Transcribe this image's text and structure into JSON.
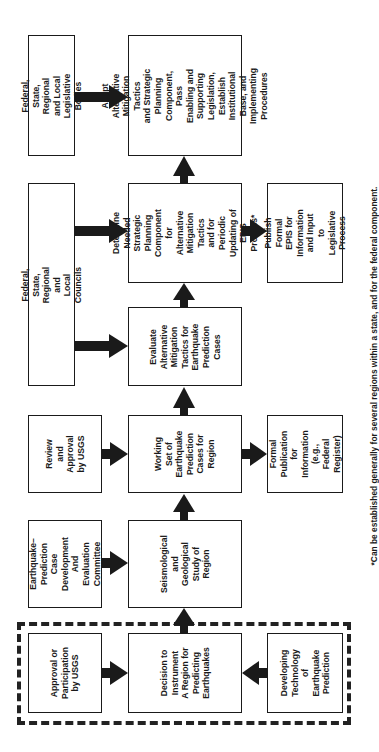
{
  "diagram": {
    "orientation": "rotated-90-ccw",
    "colors": {
      "ink": "#1a1a1a",
      "background": "#ffffff"
    },
    "boxes": {
      "legislative_bodies": "Federal, State,\nRegional and Local\nLegislative Bodies",
      "adopt": "Adopt Alternative\nMitigation Tactics\nand Strategic\nPlanning Component,\nPass Enabling and\nSupporting Legislation,\nEstablish Institutional\nBase, and Implementing\nProcedures",
      "councils": "Federal, State, Regional\nand Local Councils",
      "determine": "Determine Needed\nStrategic Planning\nComponent for\nAlternative\nMitigation Tactics\nand for Periodic\nUpdating of\nEPIS Process*",
      "publish_epis": "Publish Formal\nEPIS for\nInformation\nand Input to\nLegislative\nProcess",
      "evaluate": "Evaluate\nAlternative\nMitigation\nTactics for\nEarthquake\nPrediction\nCases",
      "review_usgs": "Review and\nApproval\nby USGS",
      "working_set": "Working\nSet of\nEarthquake\nPrediction\nCases for\nRegion",
      "formal_publication": "Formal\nPublication\nfor\nInformation\n(e.g., Federal\nRegister)",
      "committee": "Earthquake–\nPrediction Case\nDevelopment\nAnd Evaluation\nCommittee",
      "seismological": "Seismological\nand\nGeological\nStudy of\nRegion",
      "approval_usgs": "Approval or\nParticipation\nby USGS",
      "decision": "Decision to\nInstrument\nA Region for\nPredicting\nEarthquakes",
      "developing_tech": "Developing\nTechnology of\nEarthquake\nPrediction"
    },
    "flows": [
      [
        "legislative_bodies",
        "adopt"
      ],
      [
        "councils",
        "determine"
      ],
      [
        "councils",
        "evaluate"
      ],
      [
        "determine",
        "adopt"
      ],
      [
        "determine",
        "publish_epis"
      ],
      [
        "evaluate",
        "determine"
      ],
      [
        "working_set",
        "evaluate"
      ],
      [
        "review_usgs",
        "working_set"
      ],
      [
        "working_set",
        "formal_publication"
      ],
      [
        "seismological",
        "working_set"
      ],
      [
        "committee",
        "seismological"
      ],
      [
        "decision",
        "seismological"
      ],
      [
        "approval_usgs",
        "decision"
      ],
      [
        "developing_tech",
        "decision"
      ]
    ],
    "dashed_group": [
      "approval_usgs",
      "decision",
      "developing_tech"
    ],
    "footnote": "*Can be established generally for several regions within a state, and for the federal component."
  }
}
